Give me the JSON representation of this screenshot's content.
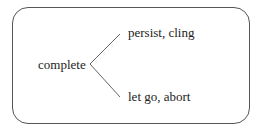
{
  "diagram": {
    "root": "complete",
    "branches": [
      {
        "label": "persist, cling"
      },
      {
        "label": "let go, abort"
      }
    ]
  }
}
